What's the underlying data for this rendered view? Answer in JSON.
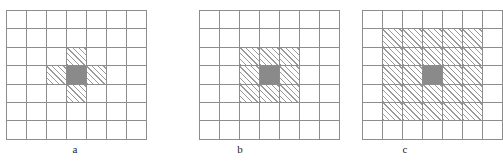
{
  "figure": {
    "background_color": "#ffffff",
    "grid_line_color": "#8d8d8d",
    "hatch_color": "#9a9a9a",
    "center_fill_color": "#8a8a8a"
  },
  "panels": [
    {
      "id": "a",
      "caption": "a",
      "grid": {
        "rows": 7,
        "cols": 7
      },
      "center_cell": {
        "row": 3,
        "col": 3
      },
      "neighbor_count": 4,
      "neighbor_cells": [
        {
          "row": 2,
          "col": 3
        },
        {
          "row": 3,
          "col": 2
        },
        {
          "row": 3,
          "col": 4
        },
        {
          "row": 4,
          "col": 3
        }
      ]
    },
    {
      "id": "b",
      "caption": "b",
      "grid": {
        "rows": 7,
        "cols": 7
      },
      "center_cell": {
        "row": 3,
        "col": 3
      },
      "neighbor_count": 8,
      "neighbor_cells": [
        {
          "row": 2,
          "col": 2
        },
        {
          "row": 2,
          "col": 3
        },
        {
          "row": 2,
          "col": 4
        },
        {
          "row": 3,
          "col": 2
        },
        {
          "row": 3,
          "col": 4
        },
        {
          "row": 4,
          "col": 2
        },
        {
          "row": 4,
          "col": 3
        },
        {
          "row": 4,
          "col": 4
        }
      ]
    },
    {
      "id": "c",
      "caption": "c",
      "grid": {
        "rows": 7,
        "cols": 7
      },
      "center_cell": {
        "row": 3,
        "col": 3
      },
      "neighbor_count": 24,
      "neighbor_cells": [
        {
          "row": 1,
          "col": 1
        },
        {
          "row": 1,
          "col": 2
        },
        {
          "row": 1,
          "col": 3
        },
        {
          "row": 1,
          "col": 4
        },
        {
          "row": 1,
          "col": 5
        },
        {
          "row": 2,
          "col": 1
        },
        {
          "row": 2,
          "col": 2
        },
        {
          "row": 2,
          "col": 3
        },
        {
          "row": 2,
          "col": 4
        },
        {
          "row": 2,
          "col": 5
        },
        {
          "row": 3,
          "col": 1
        },
        {
          "row": 3,
          "col": 2
        },
        {
          "row": 3,
          "col": 4
        },
        {
          "row": 3,
          "col": 5
        },
        {
          "row": 4,
          "col": 1
        },
        {
          "row": 4,
          "col": 2
        },
        {
          "row": 4,
          "col": 3
        },
        {
          "row": 4,
          "col": 4
        },
        {
          "row": 4,
          "col": 5
        },
        {
          "row": 5,
          "col": 1
        },
        {
          "row": 5,
          "col": 2
        },
        {
          "row": 5,
          "col": 3
        },
        {
          "row": 5,
          "col": 4
        },
        {
          "row": 5,
          "col": 5
        }
      ]
    }
  ]
}
